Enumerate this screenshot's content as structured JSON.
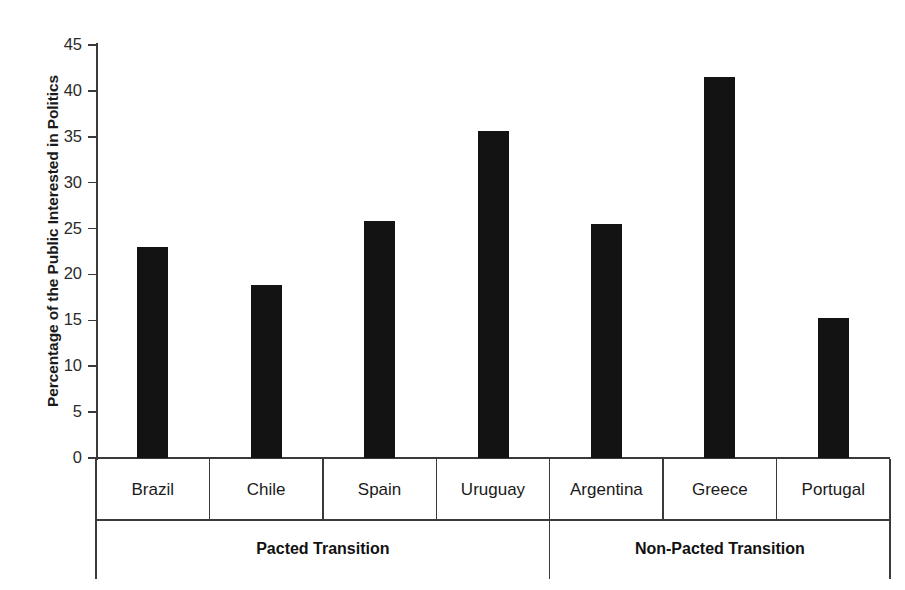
{
  "chart_data": {
    "type": "bar",
    "title": "",
    "xlabel": "",
    "ylabel": "Percentage of the Public Interested in Politics",
    "ylim": [
      0,
      45
    ],
    "ytick_step": 5,
    "yticks": [
      "45",
      "40",
      "35",
      "30",
      "25",
      "20",
      "15",
      "10",
      "5",
      "0"
    ],
    "ytick_values": [
      45,
      40,
      35,
      30,
      25,
      20,
      15,
      10,
      5,
      0
    ],
    "grid": false,
    "legend": "none",
    "bar_color": "#131313",
    "axis_color": "#3a3a3a",
    "categories": [
      "Brazil",
      "Chile",
      "Spain",
      "Uruguay",
      "Argentina",
      "Greece",
      "Portugal"
    ],
    "values": [
      23.0,
      18.9,
      25.8,
      35.6,
      25.5,
      41.5,
      15.3
    ],
    "groups": [
      {
        "label": "Pacted Transition",
        "categories": [
          "Brazil",
          "Chile",
          "Spain",
          "Uruguay"
        ]
      },
      {
        "label": "Non-Pacted Transition",
        "categories": [
          "Argentina",
          "Greece",
          "Portugal"
        ]
      }
    ]
  }
}
